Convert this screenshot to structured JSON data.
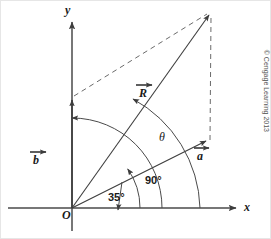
{
  "figure": {
    "type": "vector-diagram",
    "axes": {
      "x_label": "x",
      "y_label": "y",
      "origin_label": "O"
    },
    "vectors": [
      {
        "name": "a",
        "label": "a",
        "angle_deg": 35,
        "from": "O",
        "notation": "arrow-over"
      },
      {
        "name": "b",
        "label": "b",
        "angle_deg": 90,
        "from": "O",
        "notation": "arrow-over"
      },
      {
        "name": "R",
        "label": "R",
        "from": "O",
        "notation": "arrow-over",
        "role": "resultant"
      }
    ],
    "angles": [
      {
        "name": "angle-a-from-x",
        "label": "35°",
        "value": 35
      },
      {
        "name": "angle-b-from-x",
        "label": "90°",
        "value": 90
      },
      {
        "name": "angle-theta",
        "label": "θ",
        "value": null
      }
    ],
    "credit": "© Cengage Learning 2013",
    "colors": {
      "line": "#3d3d3d",
      "dashed": "#6b6b6b",
      "text": "#1a1a1a",
      "background": "#ffffff",
      "border": "#d8d8d8"
    }
  }
}
